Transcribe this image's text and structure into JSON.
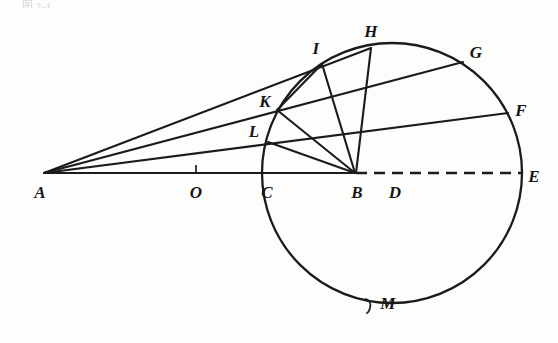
{
  "figure": {
    "title_fragment": "图 2-4",
    "type": "circle-geometry-diagram",
    "stroke_color": "#1b1b1b",
    "background_color": "#fdfdfc"
  },
  "points": [
    {
      "id": "A",
      "label": "A",
      "x": 44,
      "y": 173,
      "label_x": 40,
      "label_y": 192,
      "on": "baseline-left-vertex"
    },
    {
      "id": "O",
      "label": "O",
      "x": 196,
      "y": 173,
      "label_x": 196,
      "label_y": 192,
      "on": "baseline-tick"
    },
    {
      "id": "C",
      "label": "C",
      "x": 262,
      "y": 173,
      "label_x": 266,
      "label_y": 192,
      "on": "circle-left"
    },
    {
      "id": "B",
      "label": "B",
      "x": 355,
      "y": 173,
      "label_x": 357,
      "label_y": 192,
      "on": "baseline-hub"
    },
    {
      "id": "D",
      "label": "D",
      "x": 390,
      "y": 173,
      "label_x": 394,
      "label_y": 192,
      "on": "baseline-center"
    },
    {
      "id": "E",
      "label": "E",
      "x": 521,
      "y": 173,
      "label_x": 533,
      "label_y": 176,
      "on": "circle-right"
    },
    {
      "id": "F",
      "label": "F",
      "x": 508,
      "y": 113,
      "label_x": 521,
      "label_y": 110,
      "on": "circle"
    },
    {
      "id": "G",
      "label": "G",
      "x": 463,
      "y": 62,
      "label_x": 476,
      "label_y": 51,
      "on": "circle"
    },
    {
      "id": "H",
      "label": "H",
      "x": 371,
      "y": 48,
      "label_x": 370,
      "label_y": 31,
      "on": "circle-top"
    },
    {
      "id": "I",
      "label": "I",
      "x": 322,
      "y": 64,
      "label_x": 316,
      "label_y": 48,
      "on": "circle"
    },
    {
      "id": "K",
      "label": "K",
      "x": 277,
      "y": 110,
      "label_x": 265,
      "label_y": 100,
      "on": "circle"
    },
    {
      "id": "L",
      "label": "L",
      "x": 268,
      "y": 142,
      "label_x": 254,
      "label_y": 130,
      "on": "circle"
    },
    {
      "id": "M",
      "label": "M",
      "x": 368,
      "y": 306,
      "label_x": 387,
      "label_y": 303,
      "on": "circle-bottom-tick"
    }
  ],
  "circle": {
    "cx": 392,
    "cy": 173,
    "r": 130,
    "stroke_width": 2.2
  },
  "segments": [
    {
      "name": "baseline-A-to-B",
      "from": "A",
      "to": "B",
      "style": "solid"
    },
    {
      "name": "chord-B-to-E",
      "from": "B",
      "to": "E",
      "style": "dashed"
    },
    {
      "name": "secant-A-L-F",
      "from": "A",
      "to": "F",
      "style": "solid"
    },
    {
      "name": "secant-A-K-G",
      "from": "A",
      "to": "G",
      "style": "solid"
    },
    {
      "name": "secant-A-I-H",
      "from": "A",
      "to": "H",
      "style": "solid"
    },
    {
      "name": "radius-B-to-L",
      "from": "B",
      "to": "L",
      "style": "solid"
    },
    {
      "name": "radius-B-to-K",
      "from": "B",
      "to": "K",
      "style": "solid"
    },
    {
      "name": "radius-B-to-I",
      "from": "B",
      "to": "I",
      "style": "solid"
    },
    {
      "name": "radius-B-to-H",
      "from": "B",
      "to": "H",
      "style": "solid"
    },
    {
      "name": "chord-I-to-K",
      "from": "I",
      "to": "K",
      "style": "solid"
    }
  ],
  "ticks": [
    {
      "name": "tick-at-O",
      "x": 196,
      "y1": 166,
      "y2": 174
    },
    {
      "name": "tick-at-M",
      "x": 368,
      "y1": 298,
      "y2": 312
    }
  ]
}
